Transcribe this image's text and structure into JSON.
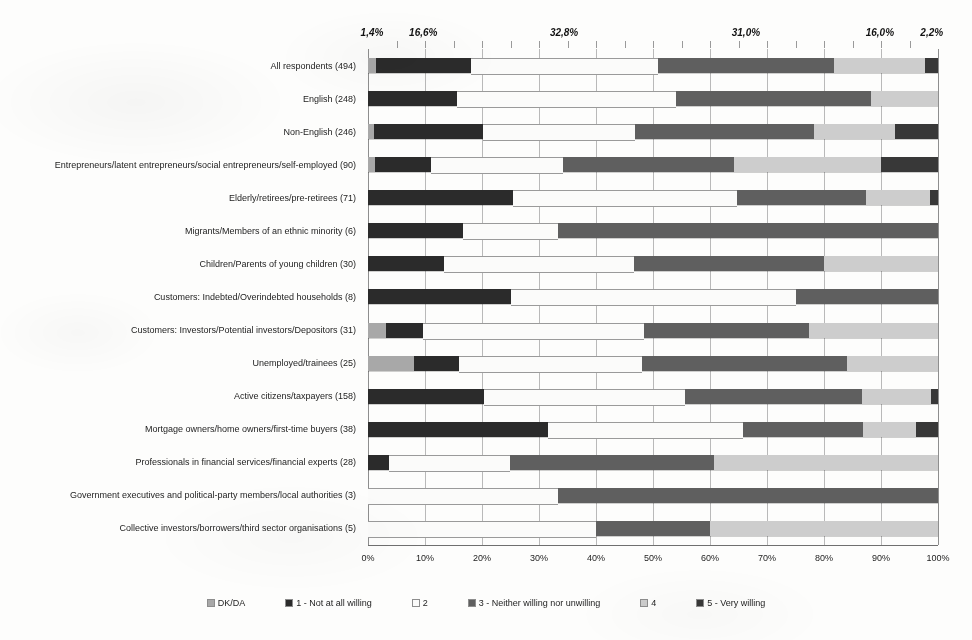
{
  "chart_data": {
    "type": "bar",
    "orientation": "horizontal",
    "stacked": true,
    "normalized_percent": true,
    "title": "",
    "xlabel": "",
    "ylabel": "",
    "xlim": [
      0,
      100
    ],
    "grid": true,
    "legend_position": "bottom",
    "xticks": [
      "0%",
      "10%",
      "20%",
      "30%",
      "40%",
      "50%",
      "60%",
      "70%",
      "80%",
      "90%",
      "100%"
    ],
    "xtick_values": [
      0,
      10,
      20,
      30,
      40,
      50,
      60,
      70,
      80,
      90,
      100
    ],
    "top_data_labels": [
      {
        "text": "1,4%",
        "value": 1.4,
        "at_percent": 0.7
      },
      {
        "text": "16,6%",
        "value": 16.6,
        "at_percent": 9.7
      },
      {
        "text": "32,8%",
        "value": 32.8,
        "at_percent": 34.4
      },
      {
        "text": "31,0%",
        "value": 31.0,
        "at_percent": 66.3
      },
      {
        "text": "16,0%",
        "value": 16.0,
        "at_percent": 89.8
      },
      {
        "text": "2,2%",
        "value": 2.2,
        "at_percent": 98.9
      }
    ],
    "series": [
      {
        "name": "DK/DA",
        "color": "#a8a8a8",
        "values": [
          1.4,
          0.0,
          1.0,
          1.2,
          0.0,
          0.0,
          0.0,
          0.0,
          3.2,
          8.0,
          0.0,
          0.0,
          0.0,
          0.0,
          0.0
        ]
      },
      {
        "name": "1 - Not at all willing",
        "color": "#2b2b2b",
        "values": [
          16.6,
          15.7,
          19.1,
          9.8,
          25.4,
          16.7,
          13.3,
          25.0,
          6.5,
          8.0,
          20.3,
          31.6,
          3.6,
          0.0,
          0.0
        ]
      },
      {
        "name": "2",
        "color": "#fbfbfa",
        "values": [
          32.8,
          38.3,
          26.8,
          23.3,
          39.4,
          16.6,
          33.3,
          50.0,
          38.7,
          32.0,
          35.4,
          34.2,
          21.4,
          33.3,
          40.0
        ]
      },
      {
        "name": "3 - Neither willing nor unwilling",
        "color": "#5f5f5f",
        "values": [
          31.0,
          34.3,
          31.3,
          30.0,
          22.5,
          66.7,
          33.4,
          25.0,
          29.0,
          36.0,
          31.0,
          21.1,
          35.7,
          66.7,
          20.0
        ]
      },
      {
        "name": "4",
        "color": "#cdcdcd",
        "values": [
          16.0,
          11.7,
          14.2,
          25.7,
          11.3,
          0.0,
          20.0,
          0.0,
          22.6,
          16.0,
          12.0,
          9.2,
          39.3,
          0.0,
          40.0
        ]
      },
      {
        "name": "5 - Very willing",
        "color": "#383838",
        "values": [
          2.2,
          0.0,
          7.6,
          10.0,
          1.4,
          0.0,
          0.0,
          0.0,
          0.0,
          0.0,
          1.3,
          3.9,
          0.0,
          0.0,
          0.0
        ]
      }
    ],
    "categories": [
      "All respondents (494)",
      "English (248)",
      "Non-English (246)",
      "Entrepreneurs/latent entrepreneurs/social entrepreneurs/self-employed (90)",
      "Elderly/retirees/pre-retirees (71)",
      "Migrants/Members of an ethnic minority (6)",
      "Children/Parents of young children (30)",
      "Customers: Indebted/Overindebted households (8)",
      "Customers: Investors/Potential investors/Depositors (31)",
      "Unemployed/trainees (25)",
      "Active citizens/taxpayers (158)",
      "Mortgage owners/home owners/first-time buyers (38)",
      "Professionals in financial services/financial experts (28)",
      "Government executives and political-party members/local authorities (3)",
      "Collective investors/borrowers/third sector organisations (5)"
    ]
  },
  "legend": {
    "items": [
      {
        "label": "DK/DA",
        "color": "#a8a8a8"
      },
      {
        "label": "1 - Not at all willing",
        "color": "#2b2b2b"
      },
      {
        "label": "2",
        "color": "#fbfbfa"
      },
      {
        "label": "3 - Neither willing nor unwilling",
        "color": "#5f5f5f"
      },
      {
        "label": "4",
        "color": "#cdcdcd"
      },
      {
        "label": "5 - Very willing",
        "color": "#383838"
      }
    ]
  }
}
